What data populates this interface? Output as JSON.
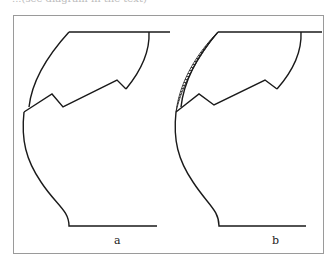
{
  "caption_fragment": "...(see diagram in the text)",
  "figure": {
    "panels": [
      {
        "id": "a",
        "label": "a",
        "hatched_region": false
      },
      {
        "id": "b",
        "label": "b",
        "hatched_region": true
      }
    ]
  },
  "colors": {
    "stroke": "#1a1a1a",
    "frame": "#9a9a9a",
    "background": "#ffffff"
  }
}
